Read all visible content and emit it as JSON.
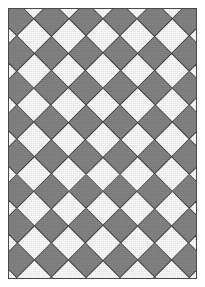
{
  "figure": {
    "caption": ""
  },
  "panel": {
    "name": "pattern-panel",
    "frame_color": "#4a4a4a",
    "background_color": "#848484",
    "margin_px": 8,
    "width_px": 189,
    "height_px": 271
  },
  "pattern": {
    "type": "diamond-checkerboard",
    "rotation_degrees": 45,
    "tile_pitch_px": 34.5,
    "columns_visible": 5.5,
    "rows_visible": 8,
    "light_color": "#fbfbfb",
    "dark_color": "#848484",
    "outline_color": "#3c3c3c",
    "grid_cells": 17,
    "edges_clipped": true
  },
  "colors": {
    "white": "#ffffff",
    "gray": "#848484",
    "outline": "#3c3c3c",
    "frame": "#4a4a4a"
  }
}
